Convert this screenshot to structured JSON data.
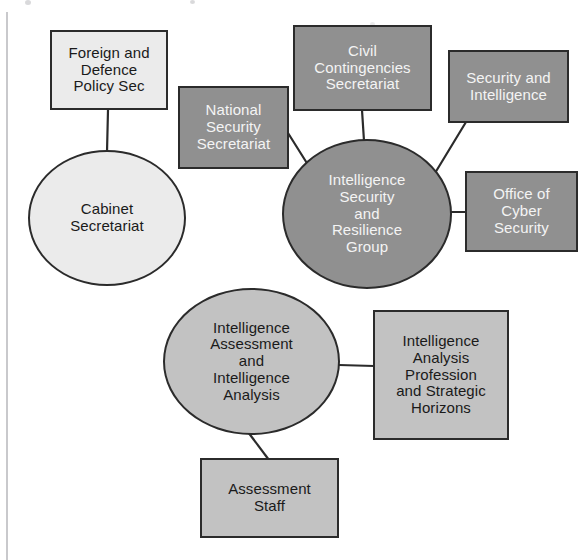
{
  "diagram": {
    "type": "org-network-diagram",
    "colors": {
      "pale_fill": "#ebebeb",
      "mid_fill": "#c2c2c2",
      "dark_fill": "#909090",
      "stroke": "#2b2b2b",
      "dark_text": "#1a1a1a",
      "light_text": "#f4f4f4",
      "background": "#ffffff"
    },
    "nodes": [
      {
        "id": "foreign-defence-policy-sec",
        "label": "Foreign and\nDefence\nPolicy Sec",
        "shape": "rectangle",
        "fill": "pale"
      },
      {
        "id": "cabinet-secretariat",
        "label": "Cabinet\nSecretariat",
        "shape": "circle",
        "fill": "pale"
      },
      {
        "id": "national-security-secretariat",
        "label": "National\nSecurity\nSecretariat",
        "shape": "rectangle",
        "fill": "dark"
      },
      {
        "id": "civil-contingencies-secretariat",
        "label": "Civil\nContingencies\nSecretariat",
        "shape": "rectangle",
        "fill": "dark"
      },
      {
        "id": "security-and-intelligence",
        "label": "Security and\nIntelligence",
        "shape": "rectangle",
        "fill": "dark"
      },
      {
        "id": "intelligence-security-and-resilience-group",
        "label": "Intelligence\nSecurity\nand\nResilience\nGroup",
        "shape": "circle",
        "fill": "dark"
      },
      {
        "id": "office-of-cyber-security",
        "label": "Office of\nCyber\nSecurity",
        "shape": "rectangle",
        "fill": "dark"
      },
      {
        "id": "intelligence-assessment-and-intelligence-analysis",
        "label": "Intelligence\nAssessment\nand\nIntelligence\nAnalysis",
        "shape": "ellipse",
        "fill": "mid"
      },
      {
        "id": "intelligence-analysis-profession-and-strategic-horizons",
        "label": "Intelligence\nAnalysis\nProfession\nand Strategic\nHorizons",
        "shape": "rectangle",
        "fill": "mid"
      },
      {
        "id": "assessment-staff",
        "label": "Assessment\nStaff",
        "shape": "rectangle",
        "fill": "mid"
      }
    ],
    "edges": [
      {
        "from": "foreign-defence-policy-sec",
        "to": "cabinet-secretariat"
      },
      {
        "from": "national-security-secretariat",
        "to": "intelligence-security-and-resilience-group"
      },
      {
        "from": "civil-contingencies-secretariat",
        "to": "intelligence-security-and-resilience-group"
      },
      {
        "from": "security-and-intelligence",
        "to": "intelligence-security-and-resilience-group"
      },
      {
        "from": "office-of-cyber-security",
        "to": "intelligence-security-and-resilience-group"
      },
      {
        "from": "intelligence-assessment-and-intelligence-analysis",
        "to": "intelligence-analysis-profession-and-strategic-horizons"
      },
      {
        "from": "intelligence-assessment-and-intelligence-analysis",
        "to": "assessment-staff"
      }
    ]
  }
}
